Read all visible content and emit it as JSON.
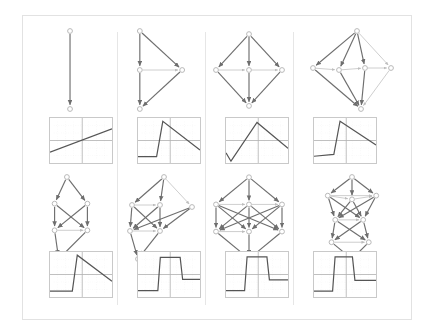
{
  "figure": {
    "kind": "grid-of-panels",
    "columns": 4,
    "rows": 4,
    "row_kinds": [
      "graph",
      "plot",
      "graph",
      "plot"
    ],
    "frame_color": "#e2e2e2",
    "divider_color": "#e6e6e6",
    "node_fill": "#ffffff",
    "node_stroke": "#b9b9b9",
    "edge_color": "#6e6e6e",
    "edge_light_color": "#bdbdbd",
    "plot_border_color": "#c9c9c9",
    "plot_axis_color": "#b0b0b0",
    "plot_grid_color": "#d8d8d8",
    "plot_trace_color": "#555555"
  },
  "graphs": [
    {
      "id": "graph-r1c1",
      "label": "two-node-chain",
      "node_count": 2,
      "edge_count": 1,
      "nodes": [
        {
          "id": "n0",
          "x": 50,
          "y": 26
        },
        {
          "id": "n1",
          "x": 50,
          "y": 66
        }
      ],
      "edges": [
        {
          "from": "n0",
          "to": "n1",
          "weight": "strong"
        }
      ]
    },
    {
      "id": "graph-r1c2",
      "label": "four-node-triangle-chain",
      "node_count": 4,
      "edge_count": 5,
      "nodes": [
        {
          "id": "n0",
          "x": 38,
          "y": 12
        },
        {
          "id": "n1",
          "x": 38,
          "y": 47
        },
        {
          "id": "n2",
          "x": 76,
          "y": 47
        },
        {
          "id": "n3",
          "x": 38,
          "y": 82
        }
      ],
      "edges": [
        {
          "from": "n0",
          "to": "n1",
          "weight": "strong"
        },
        {
          "from": "n0",
          "to": "n2",
          "weight": "strong"
        },
        {
          "from": "n1",
          "to": "n3",
          "weight": "strong"
        },
        {
          "from": "n2",
          "to": "n3",
          "weight": "strong"
        },
        {
          "from": "n1",
          "to": "n2",
          "weight": "light"
        }
      ]
    },
    {
      "id": "graph-r1c3",
      "label": "five-node-diamond",
      "node_count": 5,
      "edge_count": 8,
      "nodes": [
        {
          "id": "n0",
          "x": 48,
          "y": 10
        },
        {
          "id": "n1",
          "x": 14,
          "y": 47
        },
        {
          "id": "n2",
          "x": 48,
          "y": 47
        },
        {
          "id": "n3",
          "x": 82,
          "y": 47
        },
        {
          "id": "n4",
          "x": 48,
          "y": 84
        }
      ],
      "edges": [
        {
          "from": "n0",
          "to": "n1",
          "weight": "strong"
        },
        {
          "from": "n0",
          "to": "n2",
          "weight": "strong"
        },
        {
          "from": "n0",
          "to": "n3",
          "weight": "strong"
        },
        {
          "from": "n1",
          "to": "n4",
          "weight": "strong"
        },
        {
          "from": "n2",
          "to": "n4",
          "weight": "strong"
        },
        {
          "from": "n3",
          "to": "n4",
          "weight": "strong"
        },
        {
          "from": "n1",
          "to": "n2",
          "weight": "light"
        },
        {
          "from": "n2",
          "to": "n3",
          "weight": "light"
        }
      ]
    },
    {
      "id": "graph-r1c4",
      "label": "six-node-diamond",
      "node_count": 6,
      "edge_count": 11,
      "nodes": [
        {
          "id": "n0",
          "x": 54,
          "y": 8
        },
        {
          "id": "n1",
          "x": 10,
          "y": 45
        },
        {
          "id": "n2",
          "x": 36,
          "y": 47
        },
        {
          "id": "n3",
          "x": 62,
          "y": 45
        },
        {
          "id": "n4",
          "x": 88,
          "y": 45
        },
        {
          "id": "n5",
          "x": 58,
          "y": 86
        }
      ],
      "edges": [
        {
          "from": "n0",
          "to": "n1",
          "weight": "strong"
        },
        {
          "from": "n0",
          "to": "n2",
          "weight": "strong"
        },
        {
          "from": "n0",
          "to": "n3",
          "weight": "strong"
        },
        {
          "from": "n0",
          "to": "n4",
          "weight": "light"
        },
        {
          "from": "n1",
          "to": "n5",
          "weight": "strong"
        },
        {
          "from": "n2",
          "to": "n5",
          "weight": "strong"
        },
        {
          "from": "n3",
          "to": "n5",
          "weight": "strong"
        },
        {
          "from": "n4",
          "to": "n5",
          "weight": "light"
        },
        {
          "from": "n1",
          "to": "n2",
          "weight": "light"
        },
        {
          "from": "n2",
          "to": "n3",
          "weight": "light"
        },
        {
          "from": "n3",
          "to": "n4",
          "weight": "light"
        }
      ]
    },
    {
      "id": "graph-r3c1",
      "label": "six-node-lattice",
      "node_count": 6,
      "edge_count": 9,
      "nodes": [
        {
          "id": "n0",
          "x": 42,
          "y": 8
        },
        {
          "id": "n1",
          "x": 30,
          "y": 34
        },
        {
          "id": "n2",
          "x": 62,
          "y": 34
        },
        {
          "id": "n3",
          "x": 30,
          "y": 60
        },
        {
          "id": "n4",
          "x": 62,
          "y": 60
        },
        {
          "id": "n5",
          "x": 34,
          "y": 88
        }
      ],
      "edges": [
        {
          "from": "n0",
          "to": "n1",
          "weight": "strong"
        },
        {
          "from": "n0",
          "to": "n2",
          "weight": "strong"
        },
        {
          "from": "n1",
          "to": "n3",
          "weight": "strong"
        },
        {
          "from": "n1",
          "to": "n4",
          "weight": "strong"
        },
        {
          "from": "n2",
          "to": "n3",
          "weight": "strong"
        },
        {
          "from": "n2",
          "to": "n4",
          "weight": "strong"
        },
        {
          "from": "n3",
          "to": "n5",
          "weight": "strong"
        },
        {
          "from": "n4",
          "to": "n5",
          "weight": "strong"
        },
        {
          "from": "n3",
          "to": "n4",
          "weight": "light"
        }
      ]
    },
    {
      "id": "graph-r3c2",
      "label": "seven-node-lattice",
      "node_count": 7,
      "edge_count": 13,
      "nodes": [
        {
          "id": "n0",
          "x": 52,
          "y": 8
        },
        {
          "id": "n1",
          "x": 20,
          "y": 36
        },
        {
          "id": "n2",
          "x": 48,
          "y": 36
        },
        {
          "id": "n3",
          "x": 80,
          "y": 38
        },
        {
          "id": "n4",
          "x": 18,
          "y": 62
        },
        {
          "id": "n5",
          "x": 48,
          "y": 62
        },
        {
          "id": "n6",
          "x": 26,
          "y": 90
        }
      ],
      "edges": [
        {
          "from": "n0",
          "to": "n1",
          "weight": "strong"
        },
        {
          "from": "n0",
          "to": "n2",
          "weight": "strong"
        },
        {
          "from": "n0",
          "to": "n3",
          "weight": "light"
        },
        {
          "from": "n1",
          "to": "n4",
          "weight": "strong"
        },
        {
          "from": "n1",
          "to": "n5",
          "weight": "strong"
        },
        {
          "from": "n2",
          "to": "n4",
          "weight": "strong"
        },
        {
          "from": "n2",
          "to": "n5",
          "weight": "strong"
        },
        {
          "from": "n3",
          "to": "n4",
          "weight": "strong"
        },
        {
          "from": "n3",
          "to": "n5",
          "weight": "strong"
        },
        {
          "from": "n4",
          "to": "n6",
          "weight": "strong"
        },
        {
          "from": "n5",
          "to": "n6",
          "weight": "strong"
        },
        {
          "from": "n1",
          "to": "n2",
          "weight": "light"
        },
        {
          "from": "n4",
          "to": "n5",
          "weight": "light"
        }
      ]
    },
    {
      "id": "graph-r3c3",
      "label": "eight-node-dense-lattice",
      "node_count": 8,
      "edge_count": 18,
      "nodes": [
        {
          "id": "n0",
          "x": 48,
          "y": 8
        },
        {
          "id": "n1",
          "x": 14,
          "y": 36
        },
        {
          "id": "n2",
          "x": 48,
          "y": 36
        },
        {
          "id": "n3",
          "x": 82,
          "y": 36
        },
        {
          "id": "n4",
          "x": 14,
          "y": 64
        },
        {
          "id": "n5",
          "x": 48,
          "y": 64
        },
        {
          "id": "n6",
          "x": 82,
          "y": 64
        },
        {
          "id": "n7",
          "x": 48,
          "y": 92
        }
      ],
      "edges": [
        {
          "from": "n0",
          "to": "n1",
          "weight": "strong"
        },
        {
          "from": "n0",
          "to": "n2",
          "weight": "strong"
        },
        {
          "from": "n0",
          "to": "n3",
          "weight": "strong"
        },
        {
          "from": "n1",
          "to": "n4",
          "weight": "strong"
        },
        {
          "from": "n1",
          "to": "n5",
          "weight": "strong"
        },
        {
          "from": "n1",
          "to": "n6",
          "weight": "strong"
        },
        {
          "from": "n2",
          "to": "n4",
          "weight": "strong"
        },
        {
          "from": "n2",
          "to": "n5",
          "weight": "strong"
        },
        {
          "from": "n2",
          "to": "n6",
          "weight": "strong"
        },
        {
          "from": "n3",
          "to": "n4",
          "weight": "strong"
        },
        {
          "from": "n3",
          "to": "n5",
          "weight": "strong"
        },
        {
          "from": "n3",
          "to": "n6",
          "weight": "strong"
        },
        {
          "from": "n4",
          "to": "n7",
          "weight": "strong"
        },
        {
          "from": "n5",
          "to": "n7",
          "weight": "strong"
        },
        {
          "from": "n6",
          "to": "n7",
          "weight": "strong"
        },
        {
          "from": "n1",
          "to": "n2",
          "weight": "light"
        },
        {
          "from": "n2",
          "to": "n3",
          "weight": "light"
        },
        {
          "from": "n4",
          "to": "n5",
          "weight": "light"
        }
      ]
    },
    {
      "id": "graph-r3c4",
      "label": "nine-node-stacked-lattice",
      "node_count": 9,
      "edge_count": 20,
      "nodes": [
        {
          "id": "n0",
          "x": 44,
          "y": 6
        },
        {
          "id": "n1",
          "x": 18,
          "y": 26
        },
        {
          "id": "n2",
          "x": 44,
          "y": 30
        },
        {
          "id": "n3",
          "x": 70,
          "y": 26
        },
        {
          "id": "n4",
          "x": 26,
          "y": 52
        },
        {
          "id": "n5",
          "x": 56,
          "y": 52
        },
        {
          "id": "n6",
          "x": 22,
          "y": 76
        },
        {
          "id": "n7",
          "x": 62,
          "y": 76
        },
        {
          "id": "n8",
          "x": 44,
          "y": 94
        }
      ],
      "edges": [
        {
          "from": "n0",
          "to": "n1",
          "weight": "strong"
        },
        {
          "from": "n0",
          "to": "n2",
          "weight": "strong"
        },
        {
          "from": "n0",
          "to": "n3",
          "weight": "strong"
        },
        {
          "from": "n1",
          "to": "n4",
          "weight": "strong"
        },
        {
          "from": "n1",
          "to": "n5",
          "weight": "strong"
        },
        {
          "from": "n2",
          "to": "n4",
          "weight": "strong"
        },
        {
          "from": "n2",
          "to": "n5",
          "weight": "strong"
        },
        {
          "from": "n3",
          "to": "n4",
          "weight": "strong"
        },
        {
          "from": "n3",
          "to": "n5",
          "weight": "strong"
        },
        {
          "from": "n4",
          "to": "n6",
          "weight": "strong"
        },
        {
          "from": "n4",
          "to": "n7",
          "weight": "strong"
        },
        {
          "from": "n5",
          "to": "n6",
          "weight": "strong"
        },
        {
          "from": "n5",
          "to": "n7",
          "weight": "strong"
        },
        {
          "from": "n6",
          "to": "n8",
          "weight": "strong"
        },
        {
          "from": "n7",
          "to": "n8",
          "weight": "strong"
        },
        {
          "from": "n1",
          "to": "n2",
          "weight": "light"
        },
        {
          "from": "n2",
          "to": "n3",
          "weight": "light"
        },
        {
          "from": "n4",
          "to": "n5",
          "weight": "light"
        },
        {
          "from": "n6",
          "to": "n7",
          "weight": "light"
        },
        {
          "from": "n1",
          "to": "n3",
          "weight": "light"
        }
      ]
    }
  ],
  "chart_data": [
    {
      "id": "plot-r2c1",
      "type": "line",
      "title": "",
      "xlabel": "",
      "ylabel": "",
      "xlim": [
        0,
        100
      ],
      "ylim": [
        -1,
        1
      ],
      "grid": true,
      "axis_origin_x": 52,
      "axis_origin_y": 0,
      "legend": "none",
      "x": [
        0,
        100
      ],
      "values": [
        -0.52,
        0.52
      ],
      "shape": "rising-linear"
    },
    {
      "id": "plot-r2c2",
      "type": "line",
      "title": "",
      "xlabel": "",
      "ylabel": "",
      "xlim": [
        0,
        100
      ],
      "ylim": [
        -1,
        1
      ],
      "grid": true,
      "axis_origin_x": 52,
      "axis_origin_y": 0,
      "legend": "none",
      "x": [
        0,
        30,
        40,
        100
      ],
      "values": [
        -0.72,
        -0.72,
        0.85,
        -0.42
      ],
      "shape": "flat-rise-decay"
    },
    {
      "id": "plot-r2c3",
      "type": "line",
      "title": "",
      "xlabel": "",
      "ylabel": "",
      "xlim": [
        0,
        100
      ],
      "ylim": [
        -1,
        1
      ],
      "grid": true,
      "axis_origin_x": 52,
      "axis_origin_y": 0,
      "legend": "none",
      "x": [
        0,
        8,
        50,
        100
      ],
      "values": [
        -0.55,
        -0.92,
        0.8,
        -0.35
      ],
      "shape": "triangle-peak"
    },
    {
      "id": "plot-r2c4",
      "type": "line",
      "title": "",
      "xlabel": "",
      "ylabel": "",
      "xlim": [
        0,
        100
      ],
      "ylim": [
        -1,
        1
      ],
      "grid": true,
      "axis_origin_x": 52,
      "axis_origin_y": 0,
      "legend": "none",
      "x": [
        0,
        32,
        42,
        100
      ],
      "values": [
        -0.7,
        -0.62,
        0.86,
        -0.2
      ],
      "shape": "flat-rise-decay"
    },
    {
      "id": "plot-r4c1",
      "type": "line",
      "title": "",
      "xlabel": "",
      "ylabel": "",
      "xlim": [
        0,
        100
      ],
      "ylim": [
        -1,
        1
      ],
      "grid": true,
      "axis_origin_x": 52,
      "axis_origin_y": 0,
      "legend": "none",
      "x": [
        0,
        36,
        44,
        100
      ],
      "values": [
        -0.74,
        -0.74,
        0.86,
        -0.3
      ],
      "shape": "step-rise-decay"
    },
    {
      "id": "plot-r4c2",
      "type": "line",
      "title": "",
      "xlabel": "",
      "ylabel": "",
      "xlim": [
        0,
        100
      ],
      "ylim": [
        -1,
        1
      ],
      "grid": true,
      "axis_origin_x": 52,
      "axis_origin_y": 0,
      "legend": "none",
      "x": [
        0,
        32,
        36,
        68,
        72,
        100
      ],
      "values": [
        -0.72,
        -0.72,
        0.76,
        0.76,
        -0.22,
        -0.22
      ],
      "shape": "square-pulse"
    },
    {
      "id": "plot-r4c3",
      "type": "line",
      "title": "",
      "xlabel": "",
      "ylabel": "",
      "xlim": [
        0,
        100
      ],
      "ylim": [
        -1,
        1
      ],
      "grid": true,
      "axis_origin_x": 52,
      "axis_origin_y": 0,
      "legend": "none",
      "x": [
        0,
        30,
        34,
        66,
        70,
        100
      ],
      "values": [
        -0.72,
        -0.72,
        0.78,
        0.78,
        -0.24,
        -0.24
      ],
      "shape": "square-pulse"
    },
    {
      "id": "plot-r4c4",
      "type": "line",
      "title": "",
      "xlabel": "",
      "ylabel": "",
      "xlim": [
        0,
        100
      ],
      "ylim": [
        -1,
        1
      ],
      "grid": true,
      "axis_origin_x": 52,
      "axis_origin_y": 0,
      "legend": "none",
      "x": [
        0,
        30,
        34,
        62,
        66,
        100
      ],
      "values": [
        -0.74,
        -0.74,
        0.78,
        0.78,
        -0.26,
        -0.26
      ],
      "shape": "square-pulse"
    }
  ]
}
